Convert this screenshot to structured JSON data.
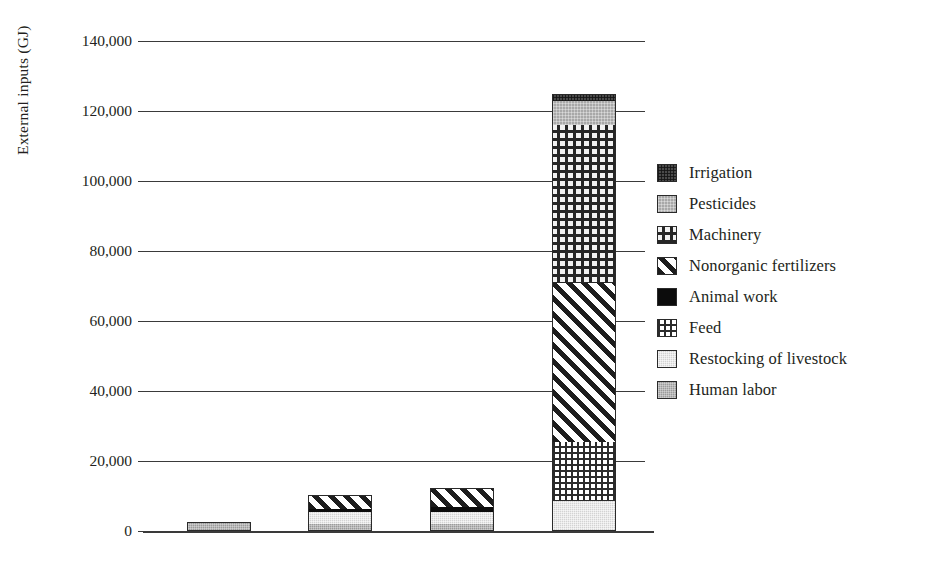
{
  "chart_data": {
    "type": "bar",
    "subtype": "stacked",
    "title": "",
    "xlabel": "",
    "ylabel": "External inputs (GJ)",
    "categories": [
      "1752",
      "1904",
      "1934",
      "1997"
    ],
    "ylim": [
      0,
      140000
    ],
    "ytick_labels": [
      "0",
      "20,000",
      "40,000",
      "60,000",
      "80,000",
      "100,000",
      "120,000",
      "140,000"
    ],
    "ytick_values": [
      0,
      20000,
      40000,
      60000,
      80000,
      100000,
      120000,
      140000
    ],
    "grid": true,
    "legend_position": "right",
    "stack_order_bottom_to_top": [
      "Human labor",
      "Restocking of livestock",
      "Feed",
      "Animal work",
      "Nonorganic fertilizers",
      "Machinery",
      "Pesticides",
      "Irrigation"
    ],
    "series": [
      {
        "name": "Human labor",
        "pattern": "solid-medium-gray",
        "color": "#9b9b9b",
        "values": [
          2500,
          2000,
          2000,
          0
        ]
      },
      {
        "name": "Restocking of livestock",
        "pattern": "solid-light-gray",
        "color": "#d3d3d3",
        "values": [
          0,
          3500,
          3500,
          8500
        ]
      },
      {
        "name": "Feed",
        "pattern": "grid-crosshatch",
        "color": "#ffffff",
        "values": [
          0,
          0,
          0,
          17000
        ]
      },
      {
        "name": "Animal work",
        "pattern": "solid-black",
        "color": "#0c0c0c",
        "values": [
          0,
          700,
          1400,
          0
        ]
      },
      {
        "name": "Nonorganic fertilizers",
        "pattern": "diagonal-stripes",
        "color": "#ffffff",
        "values": [
          0,
          4000,
          5400,
          45500
        ]
      },
      {
        "name": "Machinery",
        "pattern": "checkered-dots",
        "color": "#f2f2f2",
        "values": [
          0,
          0,
          0,
          45000
        ]
      },
      {
        "name": "Pesticides",
        "pattern": "dotted-gray",
        "color": "#a8a8a8",
        "values": [
          0,
          0,
          0,
          7000
        ]
      },
      {
        "name": "Irrigation",
        "pattern": "dotted-dark",
        "color": "#4a4a4a",
        "values": [
          0,
          0,
          0,
          2000
        ]
      }
    ],
    "totals": [
      2500,
      10200,
      12300,
      125000
    ]
  },
  "legend": {
    "items": [
      {
        "label": "Irrigation",
        "swatch": "irrigation-swatch"
      },
      {
        "label": "Pesticides",
        "swatch": "pesticides-swatch"
      },
      {
        "label": "Machinery",
        "swatch": "machinery-swatch"
      },
      {
        "label": "Nonorganic fertilizers",
        "swatch": "nonorganic-fertilizers-swatch"
      },
      {
        "label": "Animal work",
        "swatch": "animal-work-swatch"
      },
      {
        "label": "Feed",
        "swatch": "feed-swatch"
      },
      {
        "label": "Restocking of livestock",
        "swatch": "restocking-of-livestock-swatch"
      },
      {
        "label": "Human labor",
        "swatch": "human-labor-swatch"
      }
    ]
  }
}
